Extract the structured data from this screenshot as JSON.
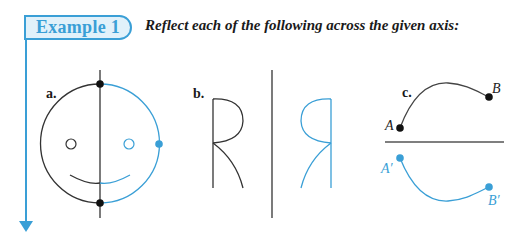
{
  "header": {
    "tab_label": "Example 1",
    "instruction": "Reflect each of the following across the given axis:"
  },
  "colors": {
    "accent": "#3a9fd6",
    "tab_fill": "#e1f1fa",
    "original": "#333333",
    "reflection": "#3a9fd6"
  },
  "figures": {
    "a": {
      "label": "a.",
      "description": "Smiley face circle reflected across a vertical axis"
    },
    "b": {
      "label": "b.",
      "description": "Letter R reflected across a vertical axis"
    },
    "c": {
      "label": "c.",
      "description": "Curve AB reflected across a horizontal axis",
      "points": {
        "A": "A",
        "B": "B",
        "A_prime": "A′",
        "B_prime": "B′"
      }
    }
  }
}
